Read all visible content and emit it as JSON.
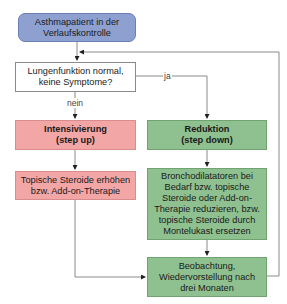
{
  "diagram": {
    "start": {
      "line1": "Asthmapatient in der",
      "line2": "Verlaufskontrolle",
      "color": "#8ea0cf"
    },
    "question": {
      "line1": "Lungenfunktion normal,",
      "line2": "keine Symptome?"
    },
    "edges": {
      "yes": "ja",
      "no": "nein"
    },
    "step_up": {
      "title": {
        "line1": "Intensivierung",
        "line2": "(step up)"
      },
      "action": {
        "line1": "Topische Steroide erhöhen",
        "line2": "bzw. Add-on-Therapie"
      },
      "color": "#f3a6a6"
    },
    "step_down": {
      "title": {
        "line1": "Reduktion",
        "line2": "(step down)"
      },
      "action": {
        "line1": "Bronchodilatatoren bei",
        "line2": "Bedarf bzw. topische",
        "line3": "Steroide oder Add-on-",
        "line4": "Therapie reduzieren, bzw.",
        "line5": "topische Steroide durch",
        "line6": "Montelukast ersetzen"
      },
      "color": "#8fc08f"
    },
    "followup": {
      "line1": "Beobachtung,",
      "line2": "Wiedervorstellung nach",
      "line3": "drei Monaten"
    }
  }
}
